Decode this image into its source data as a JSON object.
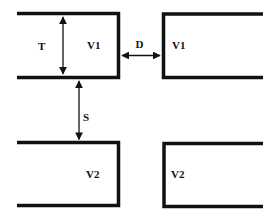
{
  "diagram": {
    "colors": {
      "stroke": "#111111",
      "background": "#ffffff"
    },
    "channels": [
      {
        "id": "top-left",
        "label": "V1"
      },
      {
        "id": "top-right",
        "label": "V1"
      },
      {
        "id": "bottom-left",
        "label": "V2"
      },
      {
        "id": "bottom-right",
        "label": "V2"
      }
    ],
    "dimensions": {
      "thickness": {
        "label": "T"
      },
      "horizontal_gap": {
        "label": "D"
      },
      "vertical_gap": {
        "label": "S"
      }
    }
  }
}
